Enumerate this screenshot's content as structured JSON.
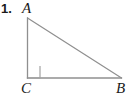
{
  "figure": {
    "problem_number": "1.",
    "background_color": "#ffffff",
    "stroke_color": "#8f8f8f",
    "label_color": "#1a1a1a",
    "width": 129,
    "height": 100,
    "shape": "right-triangle",
    "vertices": [
      {
        "id": "A",
        "label": "A",
        "x": 27,
        "y": 18,
        "label_x": 22,
        "label_y": 1
      },
      {
        "id": "C",
        "label": "C",
        "x": 27,
        "y": 78,
        "label_x": 21,
        "label_y": 81
      },
      {
        "id": "B",
        "label": "B",
        "x": 121,
        "y": 78,
        "label_x": 116,
        "label_y": 81
      }
    ],
    "sides": [
      {
        "id": "AC",
        "from": "A",
        "to": "C",
        "role": "vertical-leg"
      },
      {
        "id": "CB",
        "from": "C",
        "to": "B",
        "role": "horizontal-leg"
      },
      {
        "id": "AB",
        "from": "A",
        "to": "B",
        "role": "hypotenuse"
      }
    ],
    "right_angle_marker": {
      "at_vertex": "C",
      "x": 28,
      "y": 66,
      "size": 12
    }
  }
}
